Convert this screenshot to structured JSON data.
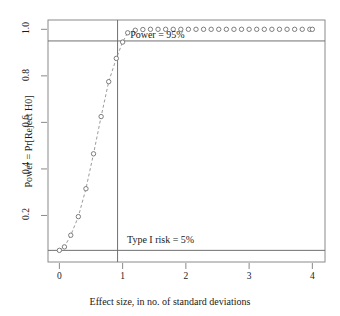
{
  "chart_data": {
    "type": "line",
    "title": "",
    "xlabel": "Effect size, in no. of standard deviations",
    "ylabel": "Power = Pr[Reject H0]",
    "xlim": [
      -0.18,
      4.2
    ],
    "ylim": [
      0.0,
      1.04
    ],
    "xticks": [
      0,
      1,
      2,
      3,
      4
    ],
    "xticklabels": [
      "0",
      "1",
      "2",
      "3",
      "4"
    ],
    "yticks": [
      0.2,
      0.4,
      0.6,
      0.8,
      1.0
    ],
    "yticklabels": [
      "0.2",
      "0.4",
      "0.6",
      "0.8",
      "1.0"
    ],
    "grid": false,
    "legend": null,
    "marker": "open-circle",
    "series": [
      {
        "name": "Power curve",
        "connected_through_index": 10,
        "x": [
          0.0,
          0.08,
          0.18,
          0.3,
          0.42,
          0.54,
          0.66,
          0.78,
          0.9,
          1.0,
          1.08,
          1.2,
          1.32,
          1.44,
          1.56,
          1.68,
          1.8,
          1.92,
          2.04,
          2.16,
          2.28,
          2.4,
          2.52,
          2.64,
          2.76,
          2.88,
          3.0,
          3.12,
          3.24,
          3.36,
          3.48,
          3.6,
          3.72,
          3.84,
          3.96,
          4.0
        ],
        "y": [
          0.05,
          0.065,
          0.115,
          0.195,
          0.315,
          0.465,
          0.625,
          0.775,
          0.875,
          0.945,
          0.985,
          0.996,
          0.999,
          1.0,
          1.0,
          1.0,
          1.0,
          1.0,
          1.0,
          1.0,
          1.0,
          1.0,
          1.0,
          1.0,
          1.0,
          1.0,
          1.0,
          1.0,
          1.0,
          1.0,
          1.0,
          1.0,
          1.0,
          1.0,
          1.0,
          1.0
        ]
      }
    ],
    "reference_lines": [
      {
        "id": "power-line",
        "orientation": "horizontal",
        "value": 0.95,
        "label": "Power = 95%",
        "label_x": 1.55,
        "label_y": 0.975
      },
      {
        "id": "alpha-line",
        "orientation": "horizontal",
        "value": 0.05,
        "label": "Type I risk = 5%",
        "label_x": 1.6,
        "label_y": 0.095
      },
      {
        "id": "effect-size-line",
        "orientation": "vertical",
        "value": 0.92,
        "label": ""
      }
    ],
    "colors": {
      "background": "#ffffff",
      "frame": "#8a8a8a",
      "marker_stroke": "#6f6f6f",
      "curve": "#8f8f8f",
      "reference_line": "#707070",
      "text": "#1a1a1a"
    }
  }
}
